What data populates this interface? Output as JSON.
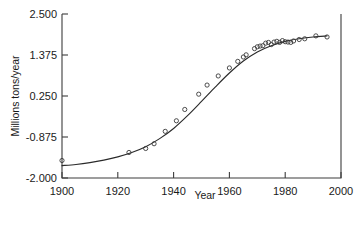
{
  "chart_data": {
    "type": "scatter",
    "title": "",
    "subtitle": "",
    "xlabel": "Year",
    "ylabel": "Millions tons/year",
    "xlim": [
      1900,
      2000
    ],
    "ylim": [
      -2.0,
      2.5
    ],
    "xticks": [
      1900,
      1920,
      1940,
      1960,
      1980,
      2000
    ],
    "xticklabels": [
      "1900",
      "1920",
      "1940",
      "1960",
      "1980",
      "2000"
    ],
    "yticks": [
      -2.0,
      -0.875,
      0.25,
      1.375,
      2.5
    ],
    "yticklabels": [
      "-2.000",
      "-0.875",
      "0.250",
      "1.375",
      "2.500"
    ],
    "grid": false,
    "legend": null,
    "legend_position": "none",
    "marker": "open-circle",
    "series": [
      {
        "name": "observed",
        "type": "scatter",
        "points": [
          [
            1900,
            -1.52
          ],
          [
            1924,
            -1.3
          ],
          [
            1930,
            -1.19
          ],
          [
            1933,
            -1.06
          ],
          [
            1937,
            -0.72
          ],
          [
            1941,
            -0.43
          ],
          [
            1944,
            -0.12
          ],
          [
            1949,
            0.3
          ],
          [
            1952,
            0.55
          ],
          [
            1956,
            0.8
          ],
          [
            1960,
            1.02
          ],
          [
            1963,
            1.2
          ],
          [
            1965,
            1.32
          ],
          [
            1966,
            1.38
          ],
          [
            1969,
            1.55
          ],
          [
            1970,
            1.6
          ],
          [
            1971,
            1.62
          ],
          [
            1972,
            1.63
          ],
          [
            1973,
            1.7
          ],
          [
            1974,
            1.72
          ],
          [
            1975,
            1.66
          ],
          [
            1976,
            1.73
          ],
          [
            1977,
            1.75
          ],
          [
            1978,
            1.72
          ],
          [
            1979,
            1.77
          ],
          [
            1980,
            1.74
          ],
          [
            1981,
            1.73
          ],
          [
            1982,
            1.72
          ],
          [
            1983,
            1.76
          ],
          [
            1985,
            1.8
          ],
          [
            1987,
            1.82
          ],
          [
            1991,
            1.9
          ],
          [
            1995,
            1.87
          ]
        ]
      },
      {
        "name": "logistic-fit",
        "type": "line",
        "points": [
          [
            1900,
            -1.66
          ],
          [
            1905,
            -1.63
          ],
          [
            1910,
            -1.58
          ],
          [
            1915,
            -1.51
          ],
          [
            1920,
            -1.42
          ],
          [
            1925,
            -1.3
          ],
          [
            1930,
            -1.14
          ],
          [
            1935,
            -0.92
          ],
          [
            1940,
            -0.64
          ],
          [
            1945,
            -0.29
          ],
          [
            1950,
            0.1
          ],
          [
            1955,
            0.5
          ],
          [
            1960,
            0.88
          ],
          [
            1965,
            1.21
          ],
          [
            1970,
            1.46
          ],
          [
            1975,
            1.63
          ],
          [
            1980,
            1.75
          ],
          [
            1985,
            1.82
          ],
          [
            1990,
            1.87
          ],
          [
            1995,
            1.9
          ]
        ]
      }
    ]
  },
  "axes": {
    "x_title": "Year",
    "y_title": "Millions tons/year"
  },
  "caption": {
    "partial_text": ""
  }
}
